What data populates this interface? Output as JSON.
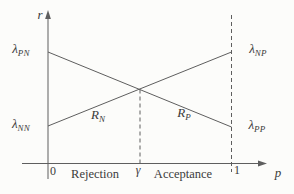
{
  "diagram": {
    "axes": {
      "y_label": "r",
      "x_label": "p"
    },
    "ticks": {
      "zero": "0",
      "gamma": "γ",
      "one": "1"
    },
    "regions": {
      "rejection": "Rejection",
      "acceptance": "Acceptance"
    },
    "labels": {
      "lambda_pn": {
        "base": "λ",
        "sub": "PN"
      },
      "lambda_nn": {
        "base": "λ",
        "sub": "NN"
      },
      "lambda_np": {
        "base": "λ",
        "sub": "NP"
      },
      "lambda_pp": {
        "base": "λ",
        "sub": "PP"
      },
      "r_n": {
        "base": "R",
        "sub": "N"
      },
      "r_p": {
        "base": "R",
        "sub": "P"
      }
    },
    "lines": {
      "descending": {
        "from": "λPN at p=0",
        "to": "λPP at p=1"
      },
      "ascending": {
        "from": "λNN at p=0",
        "to": "λNP at p=1"
      },
      "crossing_at": "γ",
      "dashed_verticals": [
        "γ",
        "1"
      ]
    }
  },
  "colors": {
    "line": "#5e5e5e",
    "text": "#3b3b3b",
    "bg": "#fcfcfa"
  }
}
